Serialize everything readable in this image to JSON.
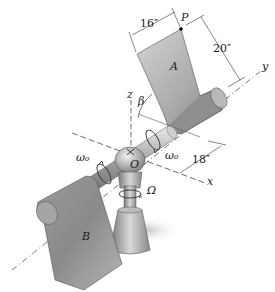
{
  "figure": {
    "labels": {
      "plate_a": "A",
      "plate_b": "B",
      "point_p": "P",
      "origin": "O",
      "axis_x": "x",
      "axis_y": "y",
      "axis_z": "z",
      "angle_beta": "β",
      "spin_rate_left": "ω₀",
      "spin_rate_right": "ω₀",
      "precession_rate": "Ω"
    },
    "dimensions": {
      "plate_width": "16″",
      "plate_height": "20″",
      "arm_offset": "18″"
    },
    "colors": {
      "plate_light": "#c9c9c9",
      "plate_dark": "#7a7a7a",
      "line": "#333333",
      "background": "#ffffff"
    }
  }
}
